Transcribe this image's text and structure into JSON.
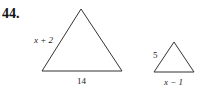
{
  "problem_number": "44.",
  "triangles": [
    {
      "side_label": "x + 2",
      "base_label": "14"
    },
    {
      "side_label": "5",
      "base_label": "x − 1"
    }
  ]
}
